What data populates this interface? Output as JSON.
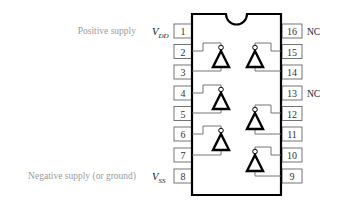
{
  "diagram": {
    "type": "IC pinout (16-pin DIP, hex inverter)",
    "left_labels": {
      "positive_supply": "Positive supply",
      "negative_supply": "Negative supply (or ground)"
    },
    "supply_symbols": {
      "vdd": {
        "main": "V",
        "sub": "DD"
      },
      "vss": {
        "main": "V",
        "sub": "SS"
      }
    },
    "pins": {
      "left": [
        "1",
        "2",
        "3",
        "4",
        "5",
        "6",
        "7",
        "8"
      ],
      "right": [
        "16",
        "15",
        "14",
        "13",
        "12",
        "11",
        "10",
        "9"
      ]
    },
    "nc_labels": {
      "pin16": "NC",
      "pin13": "NC"
    },
    "inverters": [
      {
        "input_pin": "2",
        "output_pin": "3"
      },
      {
        "input_pin": "4",
        "output_pin": "5"
      },
      {
        "input_pin": "6",
        "output_pin": "7"
      },
      {
        "input_pin": "15",
        "output_pin": "14"
      },
      {
        "input_pin": "12",
        "output_pin": "11"
      },
      {
        "input_pin": "10",
        "output_pin": "9"
      }
    ],
    "colors": {
      "chip_outline": "#000000",
      "pin_box": "#666666",
      "side_label": "#9a9a9a"
    }
  }
}
